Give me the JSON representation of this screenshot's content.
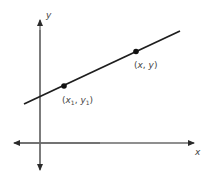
{
  "diagram": {
    "type": "coordinate-plane-line",
    "axes": {
      "x_label": "x",
      "y_label": "y",
      "color": "#6a6a6a"
    },
    "line": {
      "color": "#1e1e1e",
      "description": "straight line with positive slope"
    },
    "points": [
      {
        "id": "p1",
        "label_open": "(",
        "label_x": "x",
        "label_x_sub": "1",
        "label_sep": ", ",
        "label_y": "y",
        "label_y_sub": "1",
        "label_close": ")"
      },
      {
        "id": "p2",
        "label_open": "(",
        "label_x": "x",
        "label_sep": ", ",
        "label_y": "y",
        "label_close": ")"
      }
    ]
  }
}
